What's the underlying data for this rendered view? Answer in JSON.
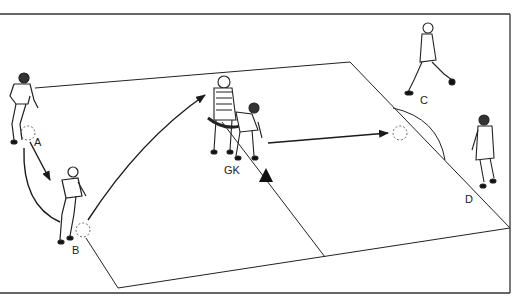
{
  "diagram": {
    "type": "soccer-drill-illustration",
    "labels": {
      "a": "A",
      "b": "B",
      "c": "C",
      "d": "D",
      "gk": "GK"
    },
    "colors": {
      "ink": "#1a1a1a",
      "background": "#ffffff"
    }
  }
}
